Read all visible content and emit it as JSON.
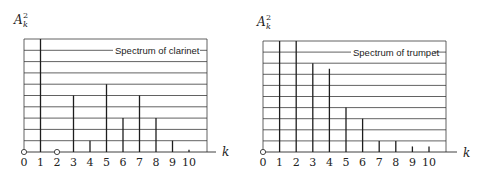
{
  "chart_data": [
    {
      "type": "bar",
      "subtype": "stem",
      "title": "Spectrum of clarinet",
      "xlabel": "k",
      "ylabel": "A_k^2",
      "ylabel_base": "A",
      "ylabel_sub": "k",
      "ylabel_sup": "2",
      "categories": [
        "0",
        "1",
        "2",
        "3",
        "4",
        "5",
        "6",
        "7",
        "8",
        "9",
        "10"
      ],
      "x": [
        0,
        1,
        2,
        3,
        4,
        5,
        6,
        7,
        8,
        9,
        10
      ],
      "values": [
        0,
        10,
        0,
        5,
        1,
        6,
        3,
        5,
        3,
        1,
        0.2
      ],
      "zero_markers": [
        0,
        2
      ],
      "ylim": [
        0,
        10
      ],
      "grid": true,
      "grid_lines": 10,
      "legend": "none"
    },
    {
      "type": "bar",
      "subtype": "stem",
      "title": "Spectrum of trumpet",
      "xlabel": "k",
      "ylabel": "A_k^2",
      "ylabel_base": "A",
      "ylabel_sub": "k",
      "ylabel_sup": "2",
      "categories": [
        "0",
        "1",
        "2",
        "3",
        "4",
        "5",
        "6",
        "7",
        "8",
        "9",
        "10"
      ],
      "x": [
        0,
        1,
        2,
        3,
        4,
        5,
        6,
        7,
        8,
        9,
        10
      ],
      "values": [
        0,
        10,
        10,
        8,
        7.5,
        4,
        3,
        1,
        1,
        0.5,
        0.5
      ],
      "zero_markers": [
        0
      ],
      "ylim": [
        0,
        10
      ],
      "grid": true,
      "grid_lines": 10,
      "legend": "none"
    }
  ],
  "layout": {
    "left": {
      "x0": 24,
      "dx": 16.5,
      "baseline": 152,
      "top": 39,
      "grid_right": 207,
      "axis_end": 216,
      "title_x": 115,
      "title_line_y": 50,
      "label_x": 14,
      "label_y": 24,
      "k_x": 222,
      "k_y": 156
    },
    "right": {
      "x0": 20,
      "dx": 16.6,
      "baseline": 152,
      "top": 41,
      "grid_right": 203,
      "axis_end": 214,
      "title_x": 110,
      "title_line_y": 52,
      "label_x": 14,
      "label_y": 26,
      "k_x": 220,
      "k_y": 157
    }
  }
}
